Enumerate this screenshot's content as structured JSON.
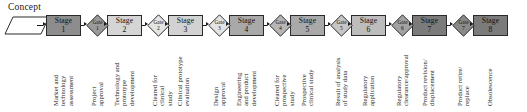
{
  "diagram": {
    "title_label": "Concept",
    "type": "stage-gate process flow",
    "concept": {
      "label": "Concept",
      "shape": "parallelogram"
    },
    "stages": [
      {
        "word": "Stage",
        "number": "1",
        "fill": "#8d8d8d",
        "x": 46,
        "w": 35
      },
      {
        "word": "Stage",
        "number": "2",
        "fill": "#d5d5d5",
        "x": 107,
        "w": 35
      },
      {
        "word": "Stage",
        "number": "3",
        "fill": "#d2d2d2",
        "x": 168,
        "w": 35
      },
      {
        "word": "Stage",
        "number": "4",
        "fill": "#a9a9a9",
        "x": 229,
        "w": 35
      },
      {
        "word": "Stage",
        "number": "5",
        "fill": "#a9a9a9",
        "x": 290,
        "w": 35
      },
      {
        "word": "Stage",
        "number": "6",
        "fill": "#bdbdbd",
        "x": 351,
        "w": 35
      },
      {
        "word": "Stage",
        "number": "7",
        "fill": "#7b7b7b",
        "x": 412,
        "w": 35
      },
      {
        "word": "Stage",
        "number": "8",
        "fill": "#7b7b7b",
        "x": 473,
        "w": 35
      }
    ],
    "gates": [
      {
        "word": "Gate",
        "number": "1",
        "fill": "#9a9a9a",
        "x": 86
      },
      {
        "word": "Gate",
        "number": "2",
        "fill": "#e4e4e4",
        "x": 147
      },
      {
        "word": "Gate",
        "number": "3",
        "fill": "#e4e4e4",
        "x": 208
      },
      {
        "word": "Gate",
        "number": "4",
        "fill": "#b6b6b6",
        "x": 269
      },
      {
        "word": "Gate",
        "number": "5",
        "fill": "#c6c6c6",
        "x": 330
      },
      {
        "word": "Gate",
        "number": "6",
        "fill": "#a2a2a2",
        "x": 391
      },
      {
        "word": "Gate",
        "number": "7",
        "fill": "#8a8a8a",
        "x": 452
      }
    ],
    "captions": [
      {
        "id": "cap-stage-1",
        "lines": [
          "Market and",
          "technology",
          "assessment"
        ],
        "x": 52,
        "top": 106
      },
      {
        "id": "cap-gate-1",
        "lines": [
          "Project",
          "approval"
        ],
        "x": 90,
        "top": 106
      },
      {
        "id": "cap-stage-2",
        "lines": [
          "Technology and",
          "prototype",
          "development"
        ],
        "x": 113,
        "top": 106
      },
      {
        "id": "cap-gate-2",
        "lines": [
          "Cleared for",
          "clinical",
          "study"
        ],
        "x": 151,
        "top": 106
      },
      {
        "id": "cap-stage-3",
        "lines": [
          "Clinical prototype",
          "evaluation"
        ],
        "x": 176,
        "top": 106
      },
      {
        "id": "cap-gate-3",
        "lines": [
          "Design",
          "approval"
        ],
        "x": 212,
        "top": 106
      },
      {
        "id": "cap-stage-4",
        "lines": [
          "Engineering",
          "and product",
          "development"
        ],
        "x": 235,
        "top": 106
      },
      {
        "id": "cap-gate-4",
        "lines": [
          "Cleared for",
          "prospective",
          "study"
        ],
        "x": 273,
        "top": 106
      },
      {
        "id": "cap-stage-5",
        "lines": [
          "Prospective",
          "clinical study"
        ],
        "x": 300,
        "top": 106
      },
      {
        "id": "cap-gate-5",
        "lines": [
          "Result of analysis",
          "of study data"
        ],
        "x": 334,
        "top": 106
      },
      {
        "id": "cap-stage-6",
        "lines": [
          "Regulatory",
          "application"
        ],
        "x": 361,
        "top": 106
      },
      {
        "id": "cap-gate-6",
        "lines": [
          "Regulatory",
          "clearance/approval"
        ],
        "x": 395,
        "top": 106
      },
      {
        "id": "cap-stage-7",
        "lines": [
          "Product revision/",
          "displacement"
        ],
        "x": 421,
        "top": 106
      },
      {
        "id": "cap-gate-7",
        "lines": [
          "Product retire/",
          "replace"
        ],
        "x": 456,
        "top": 106
      },
      {
        "id": "cap-stage-8",
        "lines": [
          "Obsolescence"
        ],
        "x": 486,
        "top": 106
      }
    ],
    "colors": {
      "stroke": "#2b2b2b",
      "text": "#1a1a1a",
      "background": "#ffffff",
      "arrow": "#1b1b1b",
      "concept_fill": "#ffffff"
    }
  }
}
